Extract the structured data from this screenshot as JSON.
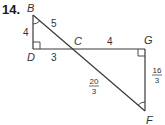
{
  "problem": {
    "number": "14."
  },
  "points": {
    "B": {
      "label": "B",
      "x": 33,
      "y": 15
    },
    "D": {
      "label": "D",
      "x": 33,
      "y": 49
    },
    "C": {
      "label": "C",
      "x": 73,
      "y": 49
    },
    "G": {
      "label": "G",
      "x": 145,
      "y": 49
    },
    "F": {
      "label": "F",
      "x": 145,
      "y": 111
    }
  },
  "lengths": {
    "BD": "4",
    "BC": "5",
    "DC": "3",
    "CG": "4",
    "CF": {
      "num": "20",
      "den": "3"
    },
    "GF": {
      "num": "16",
      "den": "3"
    }
  },
  "colors": {
    "line": "#3a3a3a",
    "text": "#333333"
  }
}
